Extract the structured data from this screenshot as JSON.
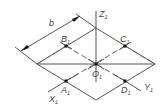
{
  "diagram": {
    "title": "",
    "type": "isometric-square-construction",
    "colors": {
      "line": "#555555",
      "point": "#111111",
      "text": "#444444",
      "background": "#ffffff"
    },
    "labels": {
      "dimension": "b",
      "axis_z": {
        "main": "Z",
        "sub": "1"
      },
      "axis_x": {
        "main": "X",
        "sub": "1"
      },
      "axis_y": {
        "main": "Y",
        "sub": "1"
      },
      "origin": {
        "main": "O",
        "sub": "1"
      },
      "point_a": {
        "main": "A",
        "sub": "1"
      },
      "point_b": {
        "main": "B",
        "sub": "1"
      },
      "point_c": {
        "main": "C",
        "sub": "1"
      },
      "point_d": {
        "main": "D",
        "sub": "1"
      }
    },
    "nodes": [
      {
        "id": "O1",
        "x": 96,
        "y": 64
      },
      {
        "id": "A1",
        "x": 66,
        "y": 81
      },
      {
        "id": "B1",
        "x": 66,
        "y": 46
      },
      {
        "id": "C1",
        "x": 125,
        "y": 46
      },
      {
        "id": "D1",
        "x": 125,
        "y": 81
      }
    ],
    "rhombus": {
      "top": [
        96,
        28
      ],
      "right": [
        155,
        64
      ],
      "bottom": [
        96,
        100
      ],
      "left": [
        37,
        64
      ]
    }
  }
}
